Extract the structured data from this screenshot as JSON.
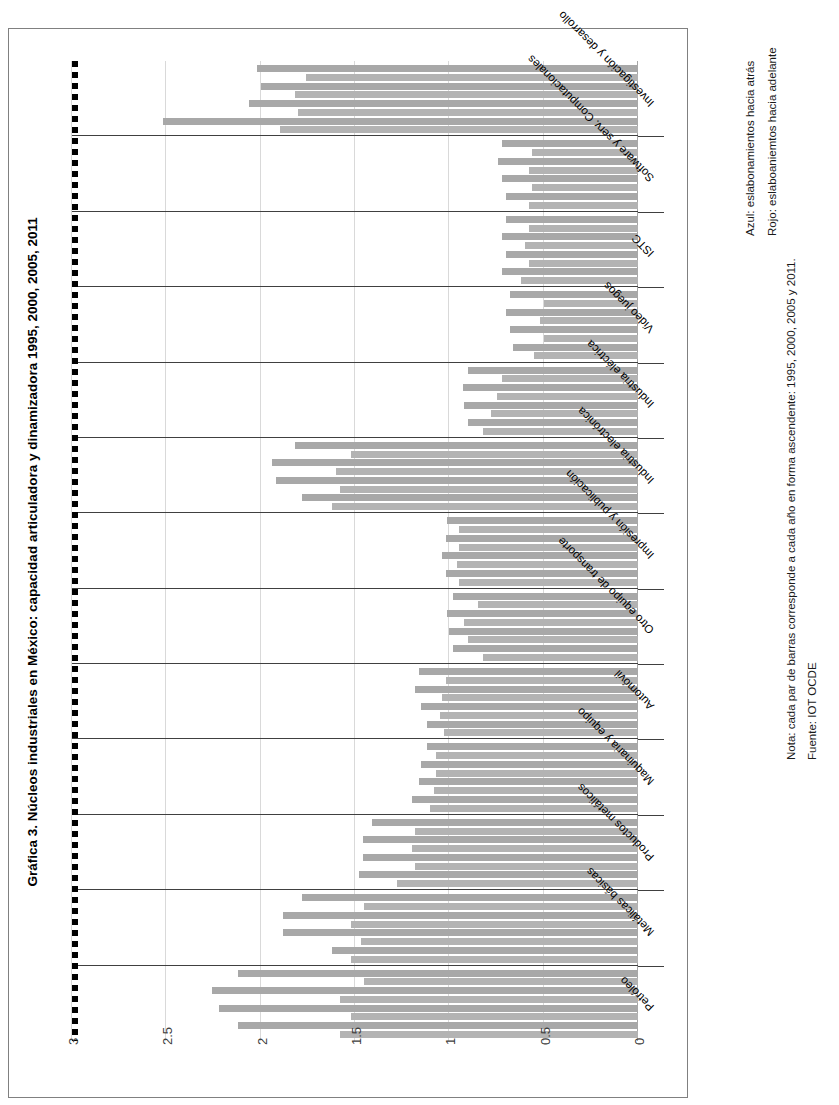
{
  "figure": {
    "title": "Gráfica 3. Núcleos industriales en México: capacidad articuladora y dinamizadora 1995, 2000, 2005, 2011",
    "legend_back": "Azul: eslabonamientos hacia atrás",
    "legend_forward": "Rojo: eslaboaniemtos hacia adelante",
    "note": "Nota:  cada par de barras corresponde a cada año en forma ascendente: 1995, 2000, 2005 y 2011.",
    "source": "Fuente: IOT OCDE"
  },
  "chart_data": {
    "type": "bar",
    "orientation": "horizontal",
    "title": "Gráfica 3. Núcleos industriales en México: capacidad articuladora y dinamizadora 1995, 2000, 2005, 2011",
    "xlabel": "",
    "ylabel": "",
    "xlim": [
      0,
      3
    ],
    "xticks": [
      "0",
      "0.5",
      "1",
      "1.5",
      "2",
      "2.5",
      "3"
    ],
    "grid": true,
    "reference_line": 1,
    "legend_position": "right",
    "years": [
      "1995",
      "2000",
      "2005",
      "2011"
    ],
    "series_names": [
      "eslabonamientos hacia atrás",
      "eslabonamientos hacia adelante"
    ],
    "categories": [
      "Petróleo",
      "Metálicas básicas",
      "Productos metálicos",
      "Maquinaria y equipo",
      "Automóvil",
      "Otro equipo de transporte",
      "Impresión y publicación",
      "Industria electrónica",
      "Industria eléctrica",
      "Video juegos",
      "ISTC",
      "Software y serv. Computacionales",
      "Investigación y desarrollo"
    ],
    "groups": [
      {
        "category": "Petróleo",
        "back": [
          1.58,
          1.52,
          1.58,
          1.45
        ],
        "forward": [
          2.12,
          2.22,
          2.26,
          2.12
        ]
      },
      {
        "category": "Metálicas básicas",
        "back": [
          1.52,
          1.47,
          1.52,
          1.45
        ],
        "forward": [
          1.62,
          1.88,
          1.88,
          1.78
        ]
      },
      {
        "category": "Productos metálicos",
        "back": [
          1.28,
          1.18,
          1.2,
          1.18
        ],
        "forward": [
          1.48,
          1.46,
          1.46,
          1.41
        ]
      },
      {
        "category": "Maquinaria y equipo",
        "back": [
          1.1,
          1.08,
          1.07,
          1.07
        ],
        "forward": [
          1.2,
          1.16,
          1.15,
          1.12
        ]
      },
      {
        "category": "Automóvil",
        "back": [
          1.03,
          1.05,
          1.04,
          1.02
        ],
        "forward": [
          1.12,
          1.15,
          1.18,
          1.16
        ]
      },
      {
        "category": "Otro equipo de transporte",
        "back": [
          0.82,
          0.9,
          0.92,
          0.85
        ],
        "forward": [
          0.98,
          1.0,
          1.01,
          0.98
        ]
      },
      {
        "category": "Impresión y publicación",
        "back": [
          0.95,
          0.96,
          0.95,
          0.95
        ],
        "forward": [
          1.02,
          1.04,
          1.02,
          1.01
        ]
      },
      {
        "category": "Industria electrónica",
        "back": [
          1.62,
          1.58,
          1.6,
          1.52
        ],
        "forward": [
          1.78,
          1.92,
          1.94,
          1.82
        ]
      },
      {
        "category": "Industria eléctrica",
        "back": [
          0.82,
          0.78,
          0.75,
          0.72
        ],
        "forward": [
          0.9,
          0.92,
          0.93,
          0.9
        ]
      },
      {
        "category": "Video juegos",
        "back": [
          0.55,
          0.5,
          0.52,
          0.5
        ],
        "forward": [
          0.66,
          0.68,
          0.7,
          0.68
        ]
      },
      {
        "category": "ISTC",
        "back": [
          0.62,
          0.58,
          0.6,
          0.58
        ],
        "forward": [
          0.72,
          0.7,
          0.72,
          0.7
        ]
      },
      {
        "category": "Software y serv. Computacionales",
        "back": [
          0.58,
          0.56,
          0.58,
          0.56
        ],
        "forward": [
          0.7,
          0.72,
          0.74,
          0.72
        ]
      },
      {
        "category": "Investigación y desarrollo",
        "back": [
          1.9,
          1.8,
          1.82,
          1.76
        ],
        "forward": [
          2.52,
          2.06,
          2.0,
          2.02
        ]
      }
    ]
  }
}
